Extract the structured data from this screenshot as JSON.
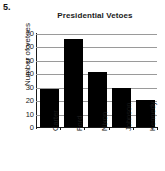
{
  "item_number": "5.",
  "chart_data": {
    "type": "bar",
    "title": "Presidential Vetoes",
    "xlabel": "",
    "ylabel": "Number of vetoes",
    "categories": [
      "Carter",
      "Ford",
      "Nixon",
      "Johnson",
      "Kennedy"
    ],
    "values": [
      29,
      66,
      42,
      30,
      21
    ],
    "ylim": [
      0,
      70
    ],
    "ytick_labels": [
      "0",
      "10",
      "20",
      "30",
      "40",
      "50",
      "60",
      "70"
    ],
    "ytick_values": [
      0,
      10,
      20,
      30,
      40,
      50,
      60,
      70
    ],
    "grid": true,
    "grid_axis": "y",
    "legend": false,
    "bar_color": "#000000",
    "grid_color": "#9a9a9a",
    "axis_color": "#1a1a1a",
    "background": "#ffffff"
  }
}
